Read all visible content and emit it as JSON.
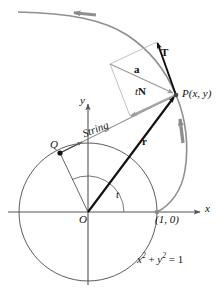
{
  "figure": {
    "kind": "involute-of-circle-diagram",
    "colors": {
      "axis": "#555555",
      "circle": "#4a4a4a",
      "involute_curve": "#808080",
      "string_line": "#777777",
      "parallelogram": "#b0b0b0",
      "vector_dark": "#111111",
      "vector_gray": "#999999",
      "label_text": "#111111",
      "background": "#ffffff"
    },
    "labels": {
      "x_axis": "x",
      "y_axis": "y",
      "origin": "O",
      "point_on_circle": "Q",
      "point_on_involute": "P(x, y)",
      "unit_point": "(1, 0)",
      "circle_equation_base": "x",
      "circle_equation": "x2 + y2 = 1",
      "string": "String",
      "angle": "t",
      "position_vector": "r",
      "tangent_vector": "T",
      "acceleration_vector": "a",
      "normal_vector_t": "t",
      "normal_vector_N": "N"
    },
    "equation_parts": {
      "x_base": "x",
      "x_exp": "2",
      "plus": " + ",
      "y_base": "y",
      "y_exp": "2",
      "equals": " = 1"
    },
    "geometry": {
      "origin_px": "88, 212",
      "unit_circle_radius_px": "69",
      "point_P_px": "176, 95",
      "point_Q_px": "60, 153",
      "unit_point_px": "157, 212",
      "angle_t_degrees": "59"
    }
  }
}
